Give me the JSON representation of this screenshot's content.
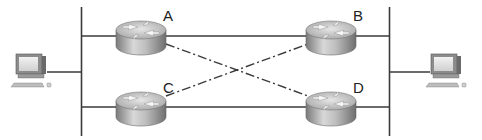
{
  "diagram": {
    "type": "network-topology",
    "segments": [
      {
        "id": "left-lan",
        "description": "left LAN segment (vertical bus)"
      },
      {
        "id": "right-lan",
        "description": "right LAN segment (vertical bus)"
      }
    ],
    "hosts": [
      {
        "id": "pc-left",
        "kind": "workstation",
        "attached_to": "left-lan"
      },
      {
        "id": "pc-right",
        "kind": "workstation",
        "attached_to": "right-lan"
      }
    ],
    "routers": [
      {
        "id": "A",
        "label": "A",
        "position": "top-left"
      },
      {
        "id": "B",
        "label": "B",
        "position": "top-right"
      },
      {
        "id": "C",
        "label": "C",
        "position": "bottom-left"
      },
      {
        "id": "D",
        "label": "D",
        "position": "bottom-right"
      }
    ],
    "links": [
      {
        "from": "left-lan",
        "to": "A",
        "style": "solid"
      },
      {
        "from": "left-lan",
        "to": "C",
        "style": "solid"
      },
      {
        "from": "A",
        "to": "B",
        "style": "solid"
      },
      {
        "from": "C",
        "to": "D",
        "style": "solid"
      },
      {
        "from": "B",
        "to": "right-lan",
        "style": "solid"
      },
      {
        "from": "D",
        "to": "right-lan",
        "style": "solid"
      },
      {
        "from": "A",
        "to": "D",
        "style": "dash-dot"
      },
      {
        "from": "C",
        "to": "B",
        "style": "dash-dot"
      }
    ],
    "colors": {
      "line": "#3a3a3a",
      "router_top": "#cfcfcf",
      "router_body": "#9a9a9a",
      "background": "#ffffff"
    }
  }
}
